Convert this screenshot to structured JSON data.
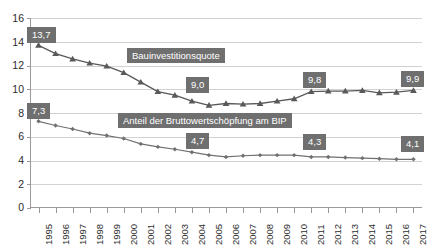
{
  "chart_data": {
    "type": "line",
    "title": "",
    "xlabel": "",
    "ylabel": "",
    "ylim": [
      0,
      16
    ],
    "yticks": [
      0,
      2,
      4,
      6,
      8,
      10,
      12,
      14,
      16
    ],
    "grid": true,
    "legend_position": "inline-annotation",
    "categories": [
      "1995",
      "1996",
      "1997",
      "1998",
      "1999",
      "2000",
      "2001",
      "2002",
      "2003",
      "2004",
      "2005",
      "2006",
      "2007",
      "2008",
      "2009",
      "2010",
      "2011",
      "2012",
      "2013",
      "2014",
      "2015",
      "2016",
      "2017"
    ],
    "series": [
      {
        "name": "Bauinvestitionsquote",
        "marker": "triangle",
        "color": "#595959",
        "values": [
          13.7,
          13.0,
          12.55,
          12.2,
          11.95,
          11.4,
          10.6,
          9.8,
          9.5,
          9.0,
          8.65,
          8.8,
          8.75,
          8.8,
          9.0,
          9.2,
          9.8,
          9.85,
          9.85,
          9.9,
          9.7,
          9.75,
          9.9
        ]
      },
      {
        "name": "Anteil der Bruttowertschöpfung am BIP",
        "marker": "diamond",
        "color": "#707070",
        "values": [
          7.3,
          6.95,
          6.65,
          6.3,
          6.1,
          5.85,
          5.4,
          5.15,
          4.95,
          4.7,
          4.45,
          4.3,
          4.4,
          4.45,
          4.45,
          4.45,
          4.3,
          4.3,
          4.25,
          4.2,
          4.15,
          4.1,
          4.1
        ]
      }
    ],
    "data_labels": [
      {
        "series": "Bauinvestitionsquote",
        "category": "1995",
        "text": "13,7",
        "value": 13.7
      },
      {
        "series": "Bauinvestitionsquote",
        "category": "2004",
        "text": "9,0",
        "value": 9.0
      },
      {
        "series": "Bauinvestitionsquote",
        "category": "2011",
        "text": "9,8",
        "value": 9.8
      },
      {
        "series": "Bauinvestitionsquote",
        "category": "2017",
        "text": "9,9",
        "value": 9.9
      },
      {
        "series": "Anteil der Bruttowertschöpfung am BIP",
        "category": "1995",
        "text": "7,3",
        "value": 7.3
      },
      {
        "series": "Anteil der Bruttowertschöpfung am BIP",
        "category": "2004",
        "text": "4,7",
        "value": 4.7
      },
      {
        "series": "Anteil der Bruttowertschöpfung am BIP",
        "category": "2011",
        "text": "4,3",
        "value": 4.3
      },
      {
        "series": "Anteil der Bruttowertschöpfung am BIP",
        "category": "2017",
        "text": "4,1",
        "value": 4.1
      }
    ],
    "annotations": [
      {
        "text": "Bauinvestitionsquote"
      },
      {
        "text": "Anteil der Bruttowertschöpfung am BIP"
      }
    ],
    "colors": {
      "series_upper": "#595959",
      "series_lower": "#707070",
      "label_box": "#6f6f6f",
      "label_text": "#ffffff",
      "grid": "#d2d2d2",
      "axis": "#9a9a9a",
      "background": "#ffffff"
    }
  },
  "axis": {
    "y_labels": [
      "16",
      "14",
      "12",
      "10",
      "8",
      "6",
      "4",
      "2",
      "0"
    ],
    "x_labels": [
      "1995",
      "1996",
      "1997",
      "1998",
      "1999",
      "2000",
      "2001",
      "2002",
      "2003",
      "2004",
      "2005",
      "2006",
      "2007",
      "2008",
      "2009",
      "2010",
      "2011",
      "2012",
      "2013",
      "2014",
      "2015",
      "2016",
      "2017"
    ]
  },
  "callouts": {
    "upper_first": "13,7",
    "upper_mid": "9,0",
    "upper_late": "9,8",
    "upper_last": "9,9",
    "lower_first": "7,3",
    "lower_mid": "4,7",
    "lower_late": "4,3",
    "lower_last": "4,1"
  },
  "legend": {
    "upper": "Bauinvestitionsquote",
    "lower": "Anteil der Bruttowertschöpfung am BIP"
  }
}
